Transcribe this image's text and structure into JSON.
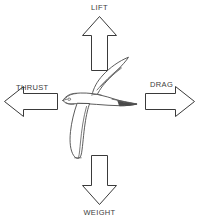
{
  "diagram": {
    "background_color": "#ffffff",
    "stroke_color": "#3a3a3a",
    "label_color": "#3c3c3c",
    "forces": [
      {
        "key": "lift",
        "label": "LIFT",
        "direction": "up",
        "icon": "block-arrow-up-icon"
      },
      {
        "key": "thrust",
        "label": "THRUST",
        "direction": "left",
        "icon": "block-arrow-left-icon"
      },
      {
        "key": "drag",
        "label": "DRAG",
        "direction": "right",
        "icon": "block-arrow-right-icon"
      },
      {
        "key": "weight",
        "label": "WEIGHT",
        "direction": "down",
        "icon": "block-arrow-down-icon"
      }
    ],
    "center_figure": {
      "name": "swift-bird-illustration",
      "description": "line drawing of a swift in flight, facing left, wings swept",
      "facing": "left"
    }
  }
}
